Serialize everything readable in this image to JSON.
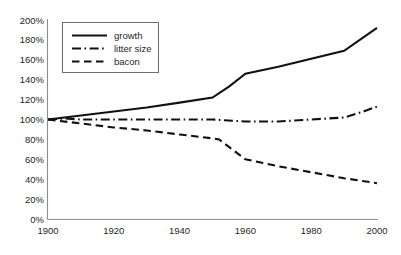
{
  "chart_data": {
    "type": "line",
    "title": "",
    "subtitle": "",
    "xlabel": "",
    "ylabel": "",
    "xlim": [
      1900,
      2000
    ],
    "ylim": [
      0,
      200
    ],
    "grid": false,
    "legend_position": "top-left",
    "x_ticks": [
      1900,
      1920,
      1940,
      1960,
      1980,
      2000
    ],
    "x_tick_labels": [
      "1900",
      "1920",
      "1940",
      "1960",
      "1980",
      "2000"
    ],
    "y_ticks": [
      0,
      20,
      40,
      60,
      80,
      100,
      120,
      140,
      160,
      180,
      200
    ],
    "y_tick_labels": [
      "0%",
      "20%",
      "40%",
      "60%",
      "80%",
      "100%",
      "120%",
      "140%",
      "160%",
      "180%",
      "200%"
    ],
    "series": [
      {
        "name": "growth",
        "style": "solid",
        "color": "#111111",
        "x": [
          1900,
          1910,
          1920,
          1930,
          1940,
          1950,
          1955,
          1960,
          1970,
          1980,
          1990,
          2000
        ],
        "values": [
          100,
          104,
          108,
          112,
          117,
          122,
          133,
          146,
          153,
          161,
          169,
          192
        ]
      },
      {
        "name": "litter size",
        "style": "dash-dot",
        "color": "#111111",
        "x": [
          1900,
          1905,
          1910,
          1920,
          1930,
          1940,
          1950,
          1960,
          1970,
          1980,
          1990,
          1995,
          2000
        ],
        "values": [
          100,
          101,
          100,
          100,
          100,
          100,
          100,
          98,
          98,
          100,
          102,
          107,
          113
        ]
      },
      {
        "name": "bacon",
        "style": "dashed",
        "color": "#111111",
        "x": [
          1900,
          1910,
          1920,
          1930,
          1940,
          1950,
          1952,
          1960,
          1970,
          1980,
          1990,
          2000
        ],
        "values": [
          100,
          96,
          92,
          89,
          85,
          81,
          80,
          60,
          53,
          47,
          41,
          36
        ]
      }
    ]
  },
  "legend": {
    "entries": [
      {
        "label": "growth"
      },
      {
        "label": "litter size"
      },
      {
        "label": "bacon"
      }
    ]
  },
  "colors": {
    "line": "#111111",
    "axis": "#8c8c8c",
    "text": "#231f20",
    "background": "#ffffff",
    "legend_border": "#6e6e6e"
  }
}
